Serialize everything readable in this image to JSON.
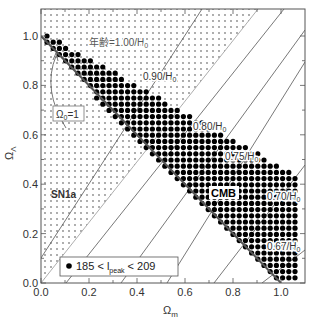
{
  "chart_data": {
    "type": "scatter",
    "title": "",
    "xlabel": "Ω_m",
    "ylabel": "Ω_Λ",
    "xlim": [
      0,
      1.1
    ],
    "ylim": [
      0,
      1.1
    ],
    "xticks": [
      "0.0",
      "0.2",
      "0.4",
      "0.6",
      "0.8",
      "1.0"
    ],
    "yticks": [
      "0.0",
      "0.2",
      "0.4",
      "0.6",
      "0.8",
      "1.0"
    ],
    "grid": false,
    "regions": [
      {
        "name": "SN1a",
        "label": "SN1a",
        "style": "dotted-fill",
        "description": "band above line from (0,0) to (~0.9,1.1)"
      },
      {
        "name": "CMB",
        "label": "CMB",
        "style": "filled-circles",
        "description": "band along Ω_m+Ω_Λ=1 for 185 < l_peak < 209"
      }
    ],
    "lines": [
      {
        "label": "Ω_0=1",
        "points": [
          [
            0,
            1.0
          ],
          [
            1.0,
            0.0
          ]
        ]
      }
    ],
    "age_contours": [
      {
        "label": "年齢=1.00/H_0"
      },
      {
        "label": "0.90/H_0"
      },
      {
        "label": "0.80/H_0"
      },
      {
        "label": "0.75/H_0"
      },
      {
        "label": "0.70/H_0"
      },
      {
        "label": "0.67/H_0"
      }
    ],
    "legend": {
      "symbol": "●",
      "text_pre": "185 < l",
      "text_sub": "peak",
      "text_post": " < 209",
      "position": "lower-left"
    }
  },
  "labels": {
    "x_axis": "Ω",
    "x_axis_sub": "m",
    "y_axis": "Ω",
    "y_axis_sub": "Λ",
    "omega0": "Ω",
    "omega0_sub": "0",
    "omega0_rest": "=1",
    "sn1a": "SN1a",
    "cmb": "CMB",
    "age100": "年齢=1.00/H",
    "age090": "0.90/H",
    "age080": "0.80/H",
    "age075": "0.75/H",
    "age070": "0.70/H",
    "age067": "0.67/H",
    "sub0": "0",
    "legend_pre": "185 < l",
    "legend_sub": "peak",
    "legend_post": " < 209"
  }
}
